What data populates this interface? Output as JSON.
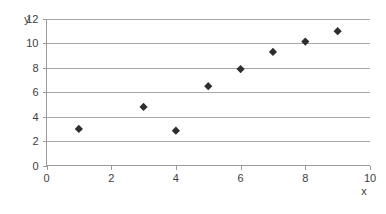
{
  "chart_data": {
    "type": "scatter",
    "title": "",
    "xlabel": "x",
    "ylabel": "y",
    "xlim": [
      0,
      10
    ],
    "ylim": [
      0,
      12
    ],
    "xticks": [
      0,
      2,
      4,
      6,
      8,
      10
    ],
    "yticks": [
      0,
      2,
      4,
      6,
      8,
      10,
      12
    ],
    "xtick_labels": [
      "0",
      "2",
      "4",
      "6",
      "8",
      "10"
    ],
    "ytick_labels": [
      "0",
      "2",
      "4",
      "6",
      "8",
      "10",
      "12"
    ],
    "grid": "horizontal",
    "legend": "none",
    "marker": "diamond",
    "marker_color": "#2e2e2e",
    "series": [
      {
        "name": "series-1",
        "x": [
          1,
          3,
          4,
          5,
          6,
          7,
          8,
          9
        ],
        "y": [
          3.0,
          4.8,
          2.85,
          6.5,
          7.9,
          9.3,
          10.15,
          11.0
        ],
        "points": [
          {
            "x": 1,
            "y": 3.0
          },
          {
            "x": 3,
            "y": 4.8
          },
          {
            "x": 4,
            "y": 2.85
          },
          {
            "x": 5,
            "y": 6.5
          },
          {
            "x": 6,
            "y": 7.9
          },
          {
            "x": 7,
            "y": 9.3
          },
          {
            "x": 8,
            "y": 10.15
          },
          {
            "x": 9,
            "y": 11.0
          }
        ]
      }
    ]
  },
  "axes": {
    "y_title": "y",
    "x_title": "x"
  }
}
